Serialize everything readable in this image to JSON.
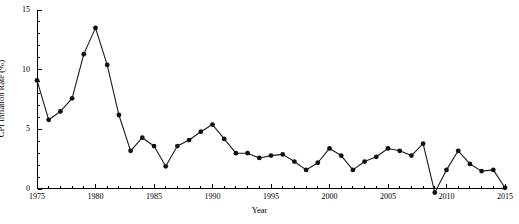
{
  "chart_data": {
    "type": "line",
    "title": "",
    "xlabel": "Year",
    "ylabel": "CPI Inflation Rate (%)",
    "xlim": [
      1975,
      2015
    ],
    "ylim": [
      0,
      15
    ],
    "yticks": [
      0,
      5,
      10,
      15
    ],
    "ytick_labels": [
      "0",
      "5",
      "10",
      "15"
    ],
    "xticks": [
      1975,
      1980,
      1985,
      1990,
      1995,
      2000,
      2005,
      2010,
      2015
    ],
    "xtick_labels": [
      "1975",
      "1980",
      "1985",
      "1990",
      "1995",
      "2000",
      "2005",
      "2010",
      "2015"
    ],
    "minor_xtick_interval": 1,
    "minor_ytick_interval": 1,
    "grid": false,
    "legend": null,
    "marker": "filled-circle",
    "line_color": "#1a1a1a",
    "marker_color": "#111111",
    "x": [
      1975,
      1976,
      1977,
      1978,
      1979,
      1980,
      1981,
      1982,
      1983,
      1984,
      1985,
      1986,
      1987,
      1988,
      1989,
      1990,
      1991,
      1992,
      1993,
      1994,
      1995,
      1996,
      1997,
      1998,
      1999,
      2000,
      2001,
      2002,
      2003,
      2004,
      2005,
      2006,
      2007,
      2008,
      2009,
      2010,
      2011,
      2012,
      2013,
      2014,
      2015
    ],
    "values": [
      9.1,
      5.8,
      6.5,
      7.6,
      11.3,
      13.5,
      10.4,
      6.2,
      3.2,
      4.3,
      3.6,
      1.9,
      3.6,
      4.1,
      4.8,
      5.4,
      4.2,
      3.0,
      3.0,
      2.6,
      2.8,
      2.9,
      2.3,
      1.6,
      2.2,
      3.4,
      2.8,
      1.6,
      2.3,
      2.7,
      3.4,
      3.2,
      2.8,
      3.8,
      -0.3,
      1.6,
      3.2,
      2.1,
      1.5,
      1.6,
      0.1
    ],
    "series": [
      {
        "name": "CPI Inflation Rate (%)",
        "values": [
          9.1,
          5.8,
          6.5,
          7.6,
          11.3,
          13.5,
          10.4,
          6.2,
          3.2,
          4.3,
          3.6,
          1.9,
          3.6,
          4.1,
          4.8,
          5.4,
          4.2,
          3.0,
          3.0,
          2.6,
          2.8,
          2.9,
          2.3,
          1.6,
          2.2,
          3.4,
          2.8,
          1.6,
          2.3,
          2.7,
          3.4,
          3.2,
          2.8,
          3.8,
          -0.3,
          1.6,
          3.2,
          2.1,
          1.5,
          1.6,
          0.1
        ]
      }
    ],
    "annotations": []
  }
}
